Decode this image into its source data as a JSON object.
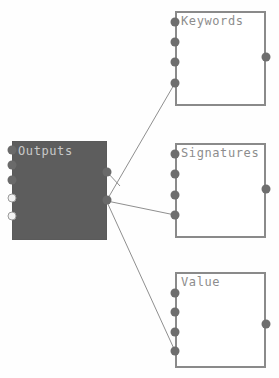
{
  "canvas": {
    "width": 279,
    "height": 378,
    "background": "#fefefe",
    "wire_color": "#8f8f8f"
  },
  "nodes": [
    {
      "id": "outputs",
      "title": "Outputs",
      "style": "filled",
      "fill_color": "#5d5d5d",
      "border_color": "#5a5a5a",
      "title_color": "#c9c9c9",
      "x": 12,
      "y": 141,
      "width": 95,
      "height": 99,
      "input_ports": [
        {
          "name": "out-port-left-1",
          "x": 12,
          "y": 150,
          "fill": "dark"
        },
        {
          "name": "out-port-left-2",
          "x": 12,
          "y": 165,
          "fill": "dark"
        },
        {
          "name": "out-port-left-3",
          "x": 12,
          "y": 180,
          "fill": "dark"
        },
        {
          "name": "out-port-left-4",
          "x": 12,
          "y": 198,
          "fill": "light"
        },
        {
          "name": "out-port-left-5",
          "x": 12,
          "y": 216,
          "fill": "light"
        }
      ],
      "output_ports": [
        {
          "name": "out-port-right-1",
          "x": 107,
          "y": 172,
          "fill": "dark"
        },
        {
          "name": "out-port-right-2",
          "x": 107,
          "y": 200,
          "fill": "dark"
        }
      ]
    },
    {
      "id": "keywords",
      "title": "Keywords",
      "style": "outline",
      "fill_color": "#ffffff",
      "border_color": "#8a8a8a",
      "title_color": "#8d8d8d",
      "x": 175,
      "y": 11,
      "width": 91,
      "height": 95,
      "input_ports": [
        {
          "name": "keywords-port-in-1",
          "x": 175,
          "y": 22,
          "fill": "dark"
        },
        {
          "name": "keywords-port-in-2",
          "x": 175,
          "y": 42,
          "fill": "dark"
        },
        {
          "name": "keywords-port-in-3",
          "x": 175,
          "y": 62,
          "fill": "dark"
        },
        {
          "name": "keywords-port-in-4",
          "x": 175,
          "y": 83,
          "fill": "dark"
        }
      ],
      "output_ports": [
        {
          "name": "keywords-port-out-1",
          "x": 266,
          "y": 57,
          "fill": "dark"
        }
      ]
    },
    {
      "id": "signatures",
      "title": "Signatures",
      "style": "outline",
      "fill_color": "#ffffff",
      "border_color": "#8a8a8a",
      "title_color": "#8d8d8d",
      "x": 175,
      "y": 143,
      "width": 91,
      "height": 95,
      "input_ports": [
        {
          "name": "signatures-port-in-1",
          "x": 175,
          "y": 154,
          "fill": "dark"
        },
        {
          "name": "signatures-port-in-2",
          "x": 175,
          "y": 174,
          "fill": "dark"
        },
        {
          "name": "signatures-port-in-3",
          "x": 175,
          "y": 195,
          "fill": "dark"
        },
        {
          "name": "signatures-port-in-4",
          "x": 175,
          "y": 215,
          "fill": "dark"
        }
      ],
      "output_ports": [
        {
          "name": "signatures-port-out-1",
          "x": 266,
          "y": 189,
          "fill": "dark"
        }
      ]
    },
    {
      "id": "value",
      "title": "Value",
      "style": "outline",
      "fill_color": "#ffffff",
      "border_color": "#8a8a8a",
      "title_color": "#8d8d8d",
      "x": 175,
      "y": 272,
      "width": 91,
      "height": 96,
      "input_ports": [
        {
          "name": "value-port-in-1",
          "x": 175,
          "y": 293,
          "fill": "dark"
        },
        {
          "name": "value-port-in-2",
          "x": 175,
          "y": 312,
          "fill": "dark"
        },
        {
          "name": "value-port-in-3",
          "x": 175,
          "y": 332,
          "fill": "dark"
        },
        {
          "name": "value-port-in-4",
          "x": 175,
          "y": 351,
          "fill": "dark"
        }
      ],
      "output_ports": [
        {
          "name": "value-port-out-1",
          "x": 266,
          "y": 324,
          "fill": "dark"
        }
      ]
    }
  ],
  "wires": [
    {
      "name": "wire-outputs-to-keywords",
      "from": {
        "x": 107,
        "y": 200
      },
      "to": {
        "x": 175,
        "y": 83
      }
    },
    {
      "name": "wire-outputs-to-signatures",
      "from": {
        "x": 107,
        "y": 201
      },
      "to": {
        "x": 175,
        "y": 215
      }
    },
    {
      "name": "wire-outputs-to-value",
      "from": {
        "x": 107,
        "y": 202
      },
      "to": {
        "x": 175,
        "y": 351
      }
    },
    {
      "name": "wire-outputs-right-stub",
      "from": {
        "x": 107,
        "y": 172
      },
      "to": {
        "x": 120,
        "y": 186
      }
    }
  ]
}
